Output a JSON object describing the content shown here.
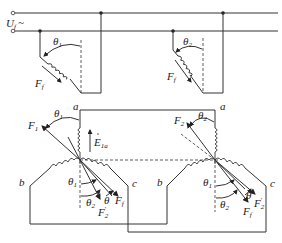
{
  "diagram": {
    "type": "electrical-schematic",
    "supply": {
      "label": "U",
      "subscript": "f",
      "symbol": "~"
    },
    "top_rotors": [
      {
        "id": "rotor-1",
        "angle_label": "θ",
        "angle_subscript": "1",
        "force_label": "F",
        "force_subscript": "f"
      },
      {
        "id": "rotor-2",
        "angle_label": "θ",
        "angle_subscript": "2",
        "force_label": "F",
        "force_subscript": "f"
      }
    ],
    "stators": [
      {
        "id": "stator-left",
        "phase_a": "a",
        "phase_b": "b",
        "phase_c": "c",
        "F_top_label": "F",
        "F_top_subscript": "1",
        "theta_top": "θ",
        "theta_top_sub": "1",
        "emf_label": "E",
        "emf_subscript": "1a",
        "theta_low1": "θ",
        "theta_low1_sub": "1",
        "theta_low2": "θ",
        "theta_low2_sub": "2",
        "theta": "θ",
        "Ff_label": "F",
        "Ff_sub": "f",
        "F2p_label": "F",
        "F2p_sub": "2",
        "F2p_prime": "′"
      },
      {
        "id": "stator-right",
        "phase_a": "a",
        "phase_b": "b",
        "phase_c": "c",
        "F_top_label": "F",
        "F_top_subscript": "2",
        "theta_top": "θ",
        "theta_top_sub": "2",
        "theta_low1": "θ",
        "theta_low1_sub": "1",
        "theta_low2": "θ",
        "theta_low2_sub": "2",
        "theta": "θ",
        "Ff_label": "F",
        "Ff_sub": "f",
        "F2p_label": "F",
        "F2p_sub": "2",
        "F2p_prime": "′"
      }
    ]
  }
}
